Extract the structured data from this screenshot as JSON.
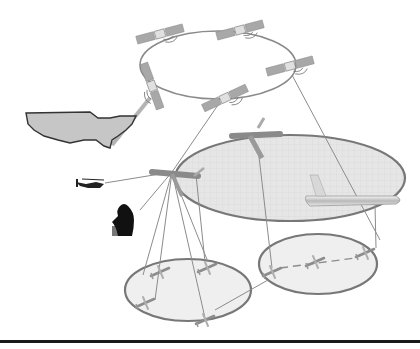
{
  "diagram": {
    "colors": {
      "background": "#ffffff",
      "ring": "#8a8a8a",
      "link": "#8c8c8c",
      "ellipse_fill": "#e4e4e4",
      "ellipse_stroke": "#7a7a7a",
      "baseline": "#1a1a1a"
    },
    "nodes": {
      "satellites": [
        {
          "id": "sat-top-left",
          "x": 160,
          "y": 35
        },
        {
          "id": "sat-top-right",
          "x": 240,
          "y": 30
        },
        {
          "id": "sat-left",
          "x": 152,
          "y": 85
        },
        {
          "id": "sat-bottom",
          "x": 225,
          "y": 100
        },
        {
          "id": "sat-right",
          "x": 290,
          "y": 68
        }
      ],
      "ground": [
        {
          "id": "continental-us",
          "x": 70,
          "y": 130
        },
        {
          "id": "helicopter",
          "x": 93,
          "y": 183
        },
        {
          "id": "soldier",
          "x": 127,
          "y": 215
        }
      ],
      "air": [
        {
          "id": "command-aircraft",
          "x": 172,
          "y": 172
        },
        {
          "id": "awacs-aircraft",
          "x": 250,
          "y": 135
        },
        {
          "id": "tanker-aircraft",
          "x": 345,
          "y": 198
        }
      ],
      "uav_clusters": [
        {
          "id": "cluster-left",
          "cx": 188,
          "cy": 290,
          "rx": 64,
          "ry": 31
        },
        {
          "id": "cluster-right",
          "cx": 316,
          "cy": 264,
          "rx": 60,
          "ry": 30
        }
      ]
    }
  }
}
